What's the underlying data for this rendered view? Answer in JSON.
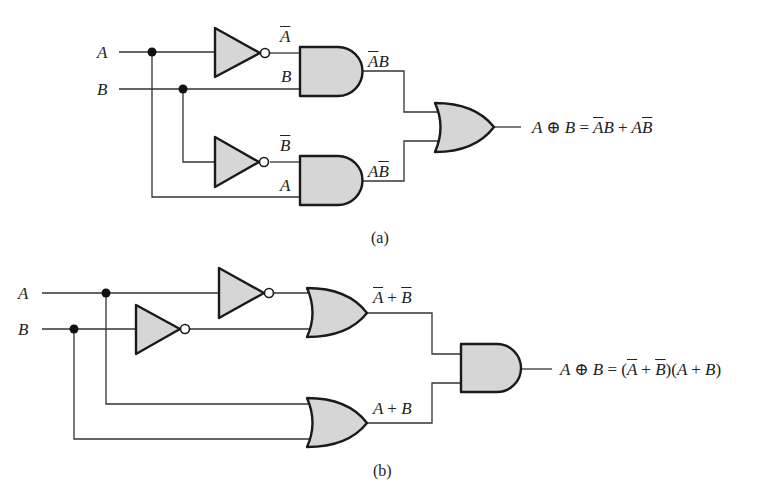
{
  "figure_a": {
    "caption": "(a)",
    "inputs": {
      "a": "A",
      "b": "B"
    },
    "gate_labels": {
      "not_a_out": "A",
      "and1_in_b": "B",
      "not_b_out": "B",
      "and2_in_a": "A",
      "and1_out": {
        "bar": "A",
        "rest": "B"
      },
      "and2_out": {
        "plain": "A",
        "bar": "B"
      }
    },
    "output_expression": {
      "lhs_a": "A",
      "xor_symbol": "⊕",
      "lhs_b": "B",
      "equals": "=",
      "t1_bar": "A",
      "t1_rest": "B",
      "plus": "+",
      "t2_plain": "A",
      "t2_bar": "B"
    },
    "gates": [
      "NOT(A)",
      "NOT(B)",
      "AND(Ā,B)",
      "AND(A,B̄)",
      "OR"
    ]
  },
  "figure_b": {
    "caption": "(b)",
    "inputs": {
      "a": "A",
      "b": "B"
    },
    "gate_labels": {
      "or1_out": {
        "a_bar": "A",
        "plus": "+",
        "b_bar": "B"
      },
      "or2_out": {
        "a": "A",
        "plus": "+",
        "b": "B"
      }
    },
    "output_expression": {
      "lhs_a": "A",
      "xor_symbol": "⊕",
      "lhs_b": "B",
      "equals": "=",
      "open1": "(",
      "a_bar": "A",
      "plus1": "+",
      "b_bar": "B",
      "close1": ")(",
      "a": "A",
      "plus2": "+",
      "b": "B",
      "close2": ")"
    },
    "gates": [
      "NOT(A)",
      "NOT(B)",
      "OR(Ā,B̄)",
      "OR(A,B)",
      "AND"
    ]
  },
  "colors": {
    "gate_fill": "#d6d6d6",
    "gate_stroke": "#1a1a1a",
    "wire": "#333333",
    "background": "#ffffff"
  }
}
